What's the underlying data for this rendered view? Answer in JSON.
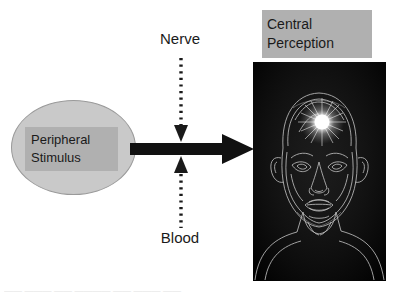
{
  "figure": {
    "background_color": "#ffffff"
  },
  "stimulus": {
    "line1": "Peripheral",
    "line2": "Stimulus",
    "ellipse_fill": "#c9c9c9",
    "label_box_fill": "#b0b0b0"
  },
  "pathways": {
    "nerve_label": "Nerve",
    "blood_label": "Blood",
    "arrow_color": "#111111"
  },
  "perception": {
    "line1": "Central",
    "line2": "Perception",
    "label_box_fill": "#b0b0b0"
  },
  "head_image": {
    "alt": "edge-detected outline of a human head with a glowing point on the forehead",
    "background_color": "#0a0a0a",
    "outline_color": "#d8d8d8",
    "glow_color": "#ffffff"
  },
  "caption": {
    "text": "——  ———  ——   ————   ——  ———  ——"
  }
}
